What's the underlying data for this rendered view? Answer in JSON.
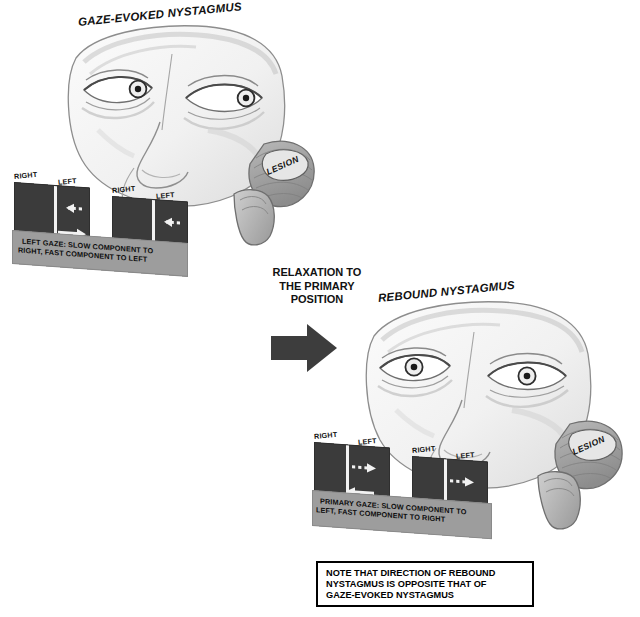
{
  "figure": {
    "domain": "medical-illustration",
    "background": "#ffffff"
  },
  "panels": {
    "gaze_evoked": {
      "title": "GAZE-EVOKED NYSTAGMUS",
      "lesion_label": "LESION",
      "eye_position": "left gaze",
      "chart": {
        "box1": {
          "left_label": "RIGHT",
          "right_label": "LEFT",
          "slow_arrow_direction": "left",
          "fast_arrow_direction": "right"
        },
        "box2": {
          "left_label": "RIGHT",
          "right_label": "LEFT",
          "slow_arrow_direction": "left",
          "fast_arrow_direction": "right"
        },
        "caption_line1": "LEFT GAZE: SLOW COMPONENT TO",
        "caption_line2": "RIGHT, FAST COMPONENT TO LEFT"
      }
    },
    "transition": {
      "line1": "RELAXATION TO",
      "line2": "THE PRIMARY",
      "line3": "POSITION",
      "arrow_direction": "right"
    },
    "rebound": {
      "title": "REBOUND NYSTAGMUS",
      "lesion_label": "LESION",
      "eye_position": "primary position",
      "chart": {
        "box1": {
          "left_label": "RIGHT",
          "right_label": "LEFT",
          "slow_arrow_direction": "right",
          "fast_arrow_direction": "left"
        },
        "box2": {
          "left_label": "RIGHT",
          "right_label": "LEFT",
          "slow_arrow_direction": "right",
          "fast_arrow_direction": "left"
        },
        "caption_line1": "PRIMARY GAZE: SLOW COMPONENT TO",
        "caption_line2": "LEFT, FAST COMPONENT TO RIGHT"
      }
    },
    "note": {
      "line1": "NOTE THAT DIRECTION OF REBOUND",
      "line2": "NYSTAGMUS IS OPPOSITE THAT OF",
      "line3": "GAZE-EVOKED NYSTAGMUS"
    }
  },
  "colors": {
    "panel_dark": "#3b3b3b",
    "caption_band": "#9d9d9d",
    "arrow_white": "#f2f2f2",
    "ink": "#111111",
    "face_fill": "#f4f4f4",
    "face_shade": "#d9d9d9",
    "cerebellum": "#9a9a9a"
  }
}
